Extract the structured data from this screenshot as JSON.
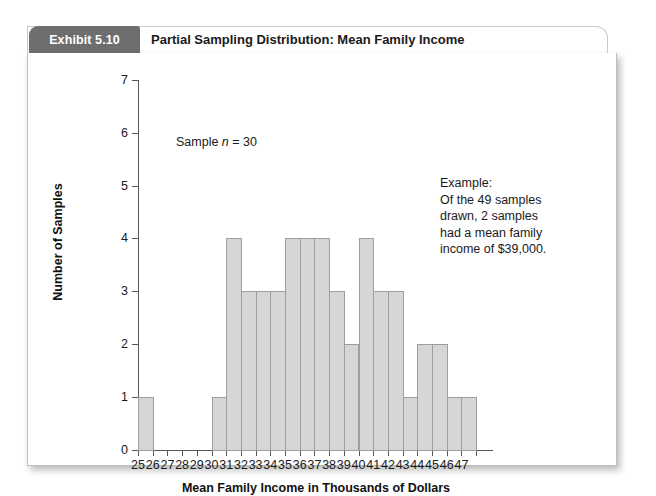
{
  "exhibit": {
    "tab_label": "Exhibit 5.10",
    "title": "Partial Sampling Distribution: Mean Family Income"
  },
  "annotations": {
    "sample_note_prefix": "Sample ",
    "sample_note_italic": "n",
    "sample_note_suffix": " = 30",
    "example_lines": [
      "Example:",
      "Of the 49 samples",
      "drawn, 2 samples",
      "had a mean family",
      "income of $39,000."
    ]
  },
  "chart_data": {
    "type": "bar",
    "title": "Partial Sampling Distribution: Mean Family Income",
    "xlabel": "Mean Family Income in Thousands of Dollars",
    "ylabel": "Number of Samples",
    "categories": [
      25,
      26,
      27,
      28,
      29,
      30,
      31,
      32,
      33,
      34,
      35,
      36,
      37,
      38,
      39,
      40,
      41,
      42,
      43,
      44,
      45,
      46,
      47
    ],
    "values": [
      1,
      0,
      0,
      0,
      0,
      1,
      4,
      3,
      3,
      3,
      4,
      4,
      4,
      3,
      2,
      4,
      3,
      3,
      1,
      2,
      2,
      1,
      1
    ],
    "x_tick_labels": [
      "25",
      "26",
      "27",
      "28",
      "29",
      "30",
      "31",
      "32",
      "33",
      "34",
      "35",
      "36",
      "37",
      "38",
      "39",
      "40",
      "41",
      "42",
      "43",
      "44",
      "45",
      "46",
      "47"
    ],
    "y_tick_labels": [
      "0",
      "1",
      "2",
      "3",
      "4",
      "5",
      "6",
      "7"
    ],
    "ylim": [
      0,
      7
    ],
    "xlim": [
      25,
      48
    ],
    "grid": false,
    "legend": false,
    "bar_color": "#d6d6d6",
    "bar_border_color": "#9e9e9e",
    "axis_color": "#575757",
    "sample_size": 30,
    "total_samples": 49
  }
}
